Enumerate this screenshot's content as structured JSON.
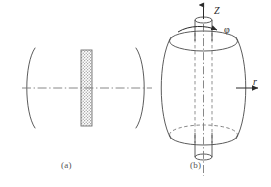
{
  "figure": {
    "title": "",
    "background_color": "#ffffff",
    "line_color": "#3a3a3a",
    "axis_line_color": "#6a6a6a",
    "hatch_color": "#8a8a8a",
    "panels": [
      {
        "id": "a",
        "caption": "(a)",
        "description": "Side view: two concave mirrors facing each other with a hatched plate on the optical axis",
        "elements": [
          {
            "name": "left-mirror-arc",
            "type": "arc"
          },
          {
            "name": "right-mirror-arc",
            "type": "arc"
          },
          {
            "name": "hatched-plate",
            "type": "rect"
          },
          {
            "name": "optical-axis",
            "type": "dash-dot-line"
          }
        ]
      },
      {
        "id": "b",
        "caption": "(b)",
        "description": "3D barrel-shaped body on a vertical rod with cylindrical coordinate axes",
        "elements": [
          {
            "name": "barrel-body",
            "type": "barrel"
          },
          {
            "name": "top-ellipse",
            "type": "ellipse"
          },
          {
            "name": "bottom-ellipse",
            "type": "ellipse"
          },
          {
            "name": "rod",
            "type": "cylinder"
          },
          {
            "name": "rotation-axis",
            "type": "dash-dot-line"
          }
        ],
        "axes": [
          {
            "name": "z-axis",
            "label": "Z",
            "direction": "up"
          },
          {
            "name": "phi-axis",
            "label": "φ",
            "direction": "azimuthal"
          },
          {
            "name": "r-axis",
            "label": "r",
            "direction": "right"
          }
        ]
      }
    ]
  },
  "labels": {
    "panel_a_caption": "(a)",
    "panel_b_caption": "(b)",
    "z_label": "Z",
    "phi_label": "φ",
    "r_label": "r"
  }
}
